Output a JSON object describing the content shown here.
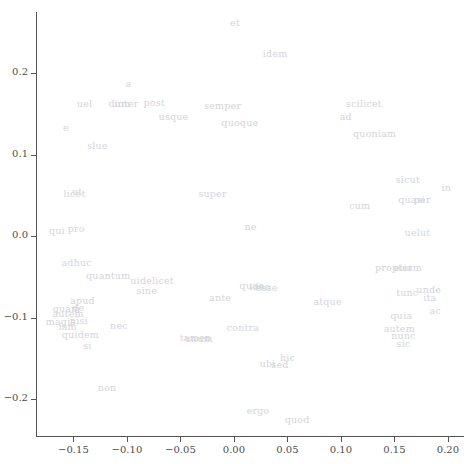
{
  "chart_data": {
    "type": "scatter",
    "title": "",
    "subtitle": "",
    "xlabel": "",
    "ylabel": "",
    "xlim": [
      -0.185,
      0.215
    ],
    "ylim": [
      -0.245,
      0.275
    ],
    "grid": false,
    "legend": null,
    "legend_position": "none",
    "annotation_color": "#d4d4d9",
    "axis_color": "#555555",
    "tick_label_color": "#4d4d4d",
    "background_color": "#ffffff",
    "xticks": [
      -0.15,
      -0.1,
      -0.05,
      0.0,
      0.05,
      0.1,
      0.15,
      0.2
    ],
    "xtick_labels": [
      "−0.15",
      "−0.10",
      "−0.05",
      "0.00",
      "0.05",
      "0.10",
      "0.15",
      "0.20"
    ],
    "yticks": [
      0.2,
      0.1,
      0.0,
      -0.1,
      -0.2
    ],
    "ytick_labels": [
      "0.2",
      "0.1",
      "0.0",
      "−0.1",
      "−0.2"
    ],
    "point_labels": [
      {
        "label": "et",
        "x": 0.001,
        "y": 0.263
      },
      {
        "label": "idem",
        "x": 0.0385,
        "y": 0.225
      },
      {
        "label": "a",
        "x": -0.0985,
        "y": 0.1875
      },
      {
        "label": "uel",
        "x": -0.1395,
        "y": 0.164
      },
      {
        "label": "dum",
        "x": -0.107,
        "y": 0.164
      },
      {
        "label": "inter",
        "x": -0.1005,
        "y": 0.164
      },
      {
        "label": "post",
        "x": -0.0745,
        "y": 0.165
      },
      {
        "label": "semper",
        "x": -0.0105,
        "y": 0.161
      },
      {
        "label": "scilicet",
        "x": 0.1215,
        "y": 0.163
      },
      {
        "label": "usque",
        "x": -0.0565,
        "y": 0.148
      },
      {
        "label": "ad",
        "x": 0.1045,
        "y": 0.148
      },
      {
        "label": "e",
        "x": -0.157,
        "y": 0.1345
      },
      {
        "label": "quoque",
        "x": 0.0055,
        "y": 0.1395
      },
      {
        "label": "quoniam",
        "x": 0.1315,
        "y": 0.127
      },
      {
        "label": "slue",
        "x": -0.1275,
        "y": 0.112
      },
      {
        "label": "sicut",
        "x": 0.1625,
        "y": 0.07
      },
      {
        "label": "in",
        "x": 0.1985,
        "y": 0.06
      },
      {
        "label": "licet",
        "x": -0.149,
        "y": 0.0525
      },
      {
        "label": "ut",
        "x": -0.1465,
        "y": 0.056
      },
      {
        "label": "super",
        "x": -0.02,
        "y": 0.0525
      },
      {
        "label": "quasi",
        "x": 0.166,
        "y": 0.046
      },
      {
        "label": "per",
        "x": 0.176,
        "y": 0.046
      },
      {
        "label": "cum",
        "x": 0.1175,
        "y": 0.0385
      },
      {
        "label": "qui",
        "x": -0.1655,
        "y": 0.008
      },
      {
        "label": "pro",
        "x": -0.1475,
        "y": 0.0095
      },
      {
        "label": "ne",
        "x": 0.0155,
        "y": 0.013
      },
      {
        "label": "uelut",
        "x": 0.1715,
        "y": 0.005
      },
      {
        "label": "adhuc",
        "x": -0.147,
        "y": -0.0315
      },
      {
        "label": "propter",
        "x": 0.1495,
        "y": -0.038
      },
      {
        "label": "etiam",
        "x": 0.1625,
        "y": -0.038
      },
      {
        "label": "quantum",
        "x": -0.1175,
        "y": -0.047
      },
      {
        "label": "uidelicet",
        "x": -0.0765,
        "y": -0.0535
      },
      {
        "label": "quae",
        "x": 0.0165,
        "y": -0.06
      },
      {
        "label": "ideo",
        "x": 0.0245,
        "y": -0.061
      },
      {
        "label": "esse",
        "x": 0.0305,
        "y": -0.062
      },
      {
        "label": "sine",
        "x": -0.0815,
        "y": -0.066
      },
      {
        "label": "tunc",
        "x": 0.162,
        "y": -0.068
      },
      {
        "label": "unde",
        "x": 0.182,
        "y": -0.065
      },
      {
        "label": "ante",
        "x": -0.013,
        "y": -0.074
      },
      {
        "label": "ita",
        "x": 0.183,
        "y": -0.075
      },
      {
        "label": "apud",
        "x": -0.1415,
        "y": -0.078
      },
      {
        "label": "atque",
        "x": 0.0875,
        "y": -0.079
      },
      {
        "label": "quam",
        "x": -0.1565,
        "y": -0.088
      },
      {
        "label": "de",
        "x": -0.1455,
        "y": -0.087
      },
      {
        "label": "ac",
        "x": 0.188,
        "y": -0.0905
      },
      {
        "label": "autem",
        "x": -0.155,
        "y": -0.0945
      },
      {
        "label": "quia",
        "x": 0.1565,
        "y": -0.096
      },
      {
        "label": "magis",
        "x": -0.162,
        "y": -0.1035
      },
      {
        "label": "nisi",
        "x": -0.145,
        "y": -0.103
      },
      {
        "label": "nec",
        "x": -0.1075,
        "y": -0.1085
      },
      {
        "label": "contra",
        "x": 0.0085,
        "y": -0.111
      },
      {
        "label": "iam",
        "x": -0.1555,
        "y": -0.1105
      },
      {
        "label": "autem",
        "x": 0.1545,
        "y": -0.113
      },
      {
        "label": "quidem",
        "x": -0.1435,
        "y": -0.1195
      },
      {
        "label": "nunc",
        "x": 0.1585,
        "y": -0.1215
      },
      {
        "label": "tamen",
        "x": -0.036,
        "y": -0.124
      },
      {
        "label": "unum",
        "x": -0.033,
        "y": -0.1245
      },
      {
        "label": "sic",
        "x": 0.1585,
        "y": -0.131
      },
      {
        "label": "si",
        "x": -0.137,
        "y": -0.133
      },
      {
        "label": "hic",
        "x": 0.05,
        "y": -0.148
      },
      {
        "label": "ubi",
        "x": 0.0315,
        "y": -0.156
      },
      {
        "label": "sed",
        "x": 0.043,
        "y": -0.157
      },
      {
        "label": "non",
        "x": -0.1185,
        "y": -0.185
      },
      {
        "label": "ergo",
        "x": 0.0225,
        "y": -0.2135
      },
      {
        "label": "quod",
        "x": 0.059,
        "y": -0.2245
      }
    ]
  }
}
